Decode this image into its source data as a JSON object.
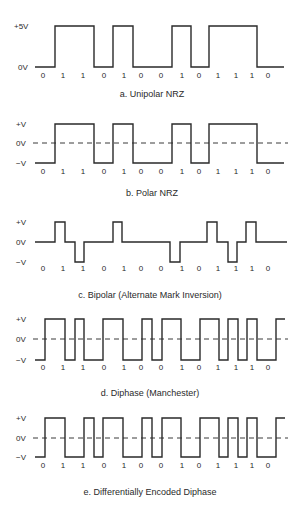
{
  "bits": [
    "0",
    "1",
    "1",
    "0",
    "1",
    "0",
    "0",
    "1",
    "0",
    "1",
    "1",
    "1",
    "0"
  ],
  "bit_label_x": [
    43,
    63,
    83,
    104,
    124,
    141,
    161,
    182,
    199,
    218,
    236,
    252,
    268
  ],
  "x_start": 35,
  "x_end": 285,
  "stroke_color": "#2a2a2a",
  "panels": [
    {
      "id": "unipolar-nrz",
      "caption": "a. Unipolar NRZ",
      "caption_y": 97,
      "levels": [
        {
          "label": "+5V",
          "y": 26
        },
        {
          "label": "0V",
          "y": 67
        }
      ],
      "zero_line": false,
      "label_y": 78,
      "waveform": [
        [
          35,
          67
        ],
        [
          55,
          67
        ],
        [
          55,
          26
        ],
        [
          94,
          26
        ],
        [
          94,
          67
        ],
        [
          113,
          67
        ],
        [
          113,
          26
        ],
        [
          133,
          26
        ],
        [
          133,
          67
        ],
        [
          172,
          67
        ],
        [
          172,
          26
        ],
        [
          191,
          26
        ],
        [
          191,
          67
        ],
        [
          209,
          67
        ],
        [
          209,
          26
        ],
        [
          257,
          26
        ],
        [
          257,
          67
        ],
        [
          284,
          67
        ]
      ]
    },
    {
      "id": "polar-nrz",
      "caption": "b. Polar NRZ",
      "caption_y": 196,
      "levels": [
        {
          "label": "+V",
          "y": 124
        },
        {
          "label": "0V",
          "y": 143
        },
        {
          "label": "−V",
          "y": 163
        }
      ],
      "zero_line": true,
      "zero_y": 143,
      "label_y": 174,
      "waveform": [
        [
          35,
          163
        ],
        [
          55,
          163
        ],
        [
          55,
          124
        ],
        [
          94,
          124
        ],
        [
          94,
          163
        ],
        [
          113,
          163
        ],
        [
          113,
          124
        ],
        [
          133,
          124
        ],
        [
          133,
          163
        ],
        [
          172,
          163
        ],
        [
          172,
          124
        ],
        [
          191,
          124
        ],
        [
          191,
          163
        ],
        [
          209,
          163
        ],
        [
          209,
          124
        ],
        [
          257,
          124
        ],
        [
          257,
          163
        ],
        [
          284,
          163
        ]
      ]
    },
    {
      "id": "bipolar-ami",
      "caption": "c. Bipolar (Alternate Mark Inversion)",
      "caption_y": 298,
      "levels": [
        {
          "label": "+V",
          "y": 222
        },
        {
          "label": "0V",
          "y": 242
        },
        {
          "label": "−V",
          "y": 262
        }
      ],
      "zero_line": false,
      "label_y": 271,
      "waveform": [
        [
          35,
          242
        ],
        [
          55,
          242
        ],
        [
          55,
          222
        ],
        [
          65,
          222
        ],
        [
          65,
          242
        ],
        [
          75,
          242
        ],
        [
          75,
          262
        ],
        [
          84,
          262
        ],
        [
          84,
          242
        ],
        [
          113,
          242
        ],
        [
          113,
          222
        ],
        [
          122,
          222
        ],
        [
          122,
          242
        ],
        [
          170,
          242
        ],
        [
          170,
          262
        ],
        [
          180,
          262
        ],
        [
          180,
          242
        ],
        [
          207,
          242
        ],
        [
          207,
          222
        ],
        [
          217,
          222
        ],
        [
          217,
          242
        ],
        [
          228,
          242
        ],
        [
          228,
          262
        ],
        [
          237,
          262
        ],
        [
          237,
          242
        ],
        [
          246,
          242
        ],
        [
          246,
          222
        ],
        [
          256,
          222
        ],
        [
          256,
          242
        ],
        [
          287,
          242
        ]
      ]
    },
    {
      "id": "diphase-manchester",
      "caption": "d. Diphase (Manchester)",
      "caption_y": 396,
      "levels": [
        {
          "label": "+V",
          "y": 319
        },
        {
          "label": "0V",
          "y": 339
        },
        {
          "label": "−V",
          "y": 360
        }
      ],
      "zero_line": true,
      "zero_y": 339,
      "label_y": 370,
      "waveform": [
        [
          35,
          360
        ],
        [
          45,
          360
        ],
        [
          45,
          319
        ],
        [
          65,
          319
        ],
        [
          65,
          360
        ],
        [
          75,
          360
        ],
        [
          75,
          319
        ],
        [
          84,
          319
        ],
        [
          84,
          360
        ],
        [
          103,
          360
        ],
        [
          103,
          319
        ],
        [
          123,
          319
        ],
        [
          123,
          360
        ],
        [
          142,
          360
        ],
        [
          142,
          319
        ],
        [
          152,
          319
        ],
        [
          152,
          360
        ],
        [
          162,
          360
        ],
        [
          162,
          319
        ],
        [
          181,
          319
        ],
        [
          181,
          360
        ],
        [
          200,
          360
        ],
        [
          200,
          319
        ],
        [
          219,
          319
        ],
        [
          219,
          360
        ],
        [
          228,
          360
        ],
        [
          228,
          319
        ],
        [
          238,
          319
        ],
        [
          238,
          360
        ],
        [
          247,
          360
        ],
        [
          247,
          319
        ],
        [
          257,
          319
        ],
        [
          257,
          360
        ],
        [
          276,
          360
        ],
        [
          276,
          319
        ],
        [
          285,
          319
        ]
      ]
    },
    {
      "id": "differential-diphase",
      "caption": "e. Differentially Encoded Diphase",
      "caption_y": 495,
      "levels": [
        {
          "label": "+V",
          "y": 418
        },
        {
          "label": "0V",
          "y": 438
        },
        {
          "label": "−V",
          "y": 457
        }
      ],
      "zero_line": true,
      "zero_y": 438,
      "label_y": 468,
      "waveform": [
        [
          35,
          457
        ],
        [
          45,
          457
        ],
        [
          45,
          418
        ],
        [
          65,
          418
        ],
        [
          65,
          457
        ],
        [
          84,
          457
        ],
        [
          84,
          418
        ],
        [
          94,
          418
        ],
        [
          94,
          457
        ],
        [
          103,
          457
        ],
        [
          103,
          418
        ],
        [
          123,
          418
        ],
        [
          123,
          457
        ],
        [
          142,
          457
        ],
        [
          142,
          418
        ],
        [
          152,
          418
        ],
        [
          152,
          457
        ],
        [
          162,
          457
        ],
        [
          162,
          418
        ],
        [
          181,
          418
        ],
        [
          181,
          457
        ],
        [
          200,
          457
        ],
        [
          200,
          418
        ],
        [
          219,
          418
        ],
        [
          219,
          457
        ],
        [
          228,
          457
        ],
        [
          228,
          418
        ],
        [
          238,
          418
        ],
        [
          238,
          457
        ],
        [
          247,
          457
        ],
        [
          247,
          418
        ],
        [
          257,
          418
        ],
        [
          257,
          457
        ],
        [
          276,
          457
        ],
        [
          276,
          418
        ],
        [
          285,
          418
        ]
      ]
    }
  ]
}
